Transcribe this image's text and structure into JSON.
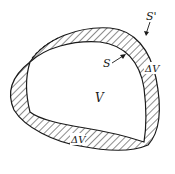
{
  "diagram": {
    "labels": {
      "outer_surface": "S'",
      "inner_surface": "S",
      "volume": "V",
      "shell_right": "ΔV",
      "shell_bottom": "ΔV"
    },
    "colors": {
      "stroke": "#1a1a1a",
      "hatch": "#1a1a1a",
      "background": "#ffffff"
    }
  }
}
